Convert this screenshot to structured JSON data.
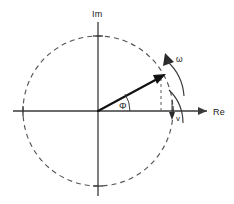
{
  "figure": {
    "name": "phasor-diagram",
    "background_color": "#ffffff",
    "line_color": "#3a3a3a",
    "vector_color": "#111111"
  },
  "axes": {
    "imaginary": {
      "label": "Im",
      "orientation": "vertical"
    },
    "real": {
      "label": "Re",
      "orientation": "horizontal",
      "arrowhead": "right-arrow-icon"
    }
  },
  "circle": {
    "name": "unit-circle",
    "style": "dashed",
    "center_x": 98,
    "center_y": 111,
    "radius": 75
  },
  "vector": {
    "name": "phasor-vector",
    "label": "",
    "angle_label": "Φ",
    "tip_x": 164,
    "tip_y": 74,
    "origin_x": 98,
    "origin_y": 111
  },
  "annotations": {
    "angular_velocity": "ω",
    "velocity_marker": "v",
    "projection": "dashed-projection-line"
  }
}
